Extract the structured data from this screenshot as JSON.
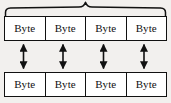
{
  "diagram": {
    "type": "block-diagram",
    "colors": {
      "background": "#f2f0ee",
      "stroke": "#111111",
      "box_fill": "#ffffff"
    },
    "brace": {
      "name": "top-curly-brace",
      "orientation": "horizontal",
      "label": "",
      "spans": "all four top bytes"
    },
    "top_row": {
      "name": "upper-byte-row",
      "cells": [
        {
          "label": "Byte"
        },
        {
          "label": "Byte"
        },
        {
          "label": "Byte"
        },
        {
          "label": "Byte"
        }
      ]
    },
    "bottom_row": {
      "name": "lower-byte-row",
      "cells": [
        {
          "label": "Byte"
        },
        {
          "label": "Byte"
        },
        {
          "label": "Byte"
        },
        {
          "label": "Byte"
        }
      ]
    },
    "connectors": [
      {
        "name": "double-arrow-1",
        "style": "double-headed-vertical"
      },
      {
        "name": "double-arrow-2",
        "style": "double-headed-vertical"
      },
      {
        "name": "double-arrow-3",
        "style": "double-headed-vertical"
      },
      {
        "name": "double-arrow-4",
        "style": "double-headed-vertical"
      }
    ]
  }
}
